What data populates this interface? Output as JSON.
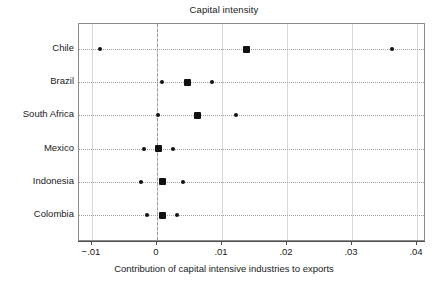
{
  "chart_data": {
    "type": "scatter",
    "title": "Capital intensity",
    "xlabel": "Contribution of capital intensive industries to exports",
    "ylabel": "",
    "xlim": [
      -0.012,
      0.0415
    ],
    "xticks": [
      -0.01,
      0,
      0.01,
      0.02,
      0.03,
      0.04
    ],
    "xticklabels": [
      "−.01",
      "0",
      ".01",
      ".02",
      ".03",
      ".04"
    ],
    "grid": "vertical-gridlines-and-horizontal-dotted-rows",
    "zero_reference_line": 0,
    "legend": "none",
    "categories": [
      "Chile",
      "Brazil",
      "South Africa",
      "Mexico",
      "Indonesia",
      "Colombia"
    ],
    "series": [
      {
        "name": "lower bound",
        "marker": "small-dot",
        "values": [
          -0.0087,
          0.0007,
          0.0002,
          -0.002,
          -0.0024,
          -0.0016
        ]
      },
      {
        "name": "point estimate",
        "marker": "large-square",
        "values": [
          0.0137,
          0.0047,
          0.0063,
          0.0003,
          0.0009,
          0.0008
        ]
      },
      {
        "name": "upper bound",
        "marker": "small-dot",
        "values": [
          0.0362,
          0.0085,
          0.0122,
          0.0024,
          0.004,
          0.0031
        ]
      }
    ],
    "points": [
      {
        "category": "Chile",
        "low": -0.0087,
        "estimate": 0.0137,
        "high": 0.0362
      },
      {
        "category": "Brazil",
        "low": 0.0007,
        "estimate": 0.0047,
        "high": 0.0085
      },
      {
        "category": "South Africa",
        "low": 0.0002,
        "estimate": 0.0063,
        "high": 0.0122
      },
      {
        "category": "Mexico",
        "low": -0.002,
        "estimate": 0.0003,
        "high": 0.0024
      },
      {
        "category": "Indonesia",
        "low": -0.0024,
        "estimate": 0.0009,
        "high": 0.004
      },
      {
        "category": "Colombia",
        "low": -0.0016,
        "estimate": 0.0008,
        "high": 0.0031
      }
    ],
    "colors": {
      "marker": "#111111",
      "frame": "#8c8c8c",
      "gridline": "#d9d9d9",
      "rowline": "#9e9e9e",
      "zero_line": "#9a9a9a",
      "axis": "#4d4d4d",
      "text": "#1a1a1a",
      "background": "#ffffff"
    }
  }
}
